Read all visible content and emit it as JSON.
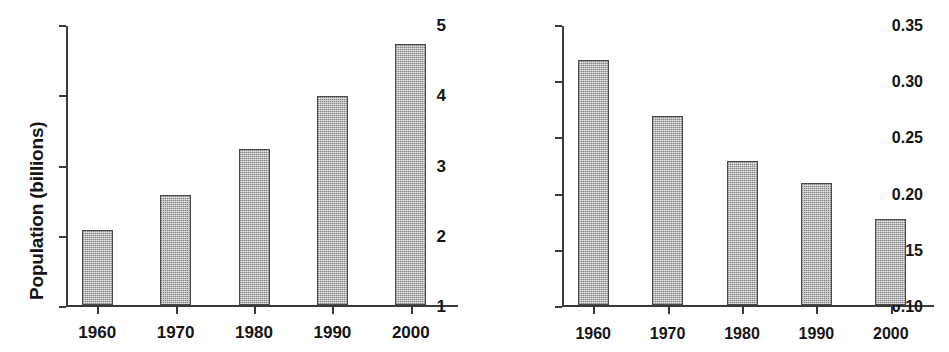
{
  "figure": {
    "background_color": "#ffffff",
    "bar_fill_color": "#b9b9b9",
    "bar_border_color": "#4a4a4a",
    "axis_color": "#3a3a3a",
    "text_color": "#151515"
  },
  "chart_data": [
    {
      "type": "bar",
      "title": "",
      "xlabel": "",
      "ylabel": "Population (billions)",
      "categories": [
        "1960",
        "1970",
        "1980",
        "1990",
        "2000"
      ],
      "values": [
        2.1,
        2.6,
        3.25,
        4.0,
        4.75
      ],
      "ylim": [
        1,
        5
      ],
      "yticks": [
        1,
        2,
        3,
        4,
        5
      ],
      "ytick_labels": [
        "1",
        "2",
        "3",
        "4",
        "5"
      ],
      "grid": false,
      "legend": false
    },
    {
      "type": "bar",
      "title": "",
      "xlabel": "",
      "ylabel": "Arable land per capita (ha)",
      "categories": [
        "1960",
        "1970",
        "1980",
        "1990",
        "2000"
      ],
      "values": [
        0.32,
        0.27,
        0.23,
        0.21,
        0.178
      ],
      "ylim": [
        0.1,
        0.35
      ],
      "yticks": [
        0.1,
        0.15,
        0.2,
        0.25,
        0.3,
        0.35
      ],
      "ytick_labels": [
        "0.10",
        "0.15",
        "0.20",
        "0.25",
        "0.30",
        "0.35"
      ],
      "grid": false,
      "legend": false
    }
  ]
}
